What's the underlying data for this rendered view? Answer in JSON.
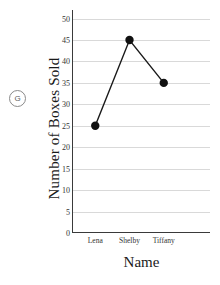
{
  "part_label": "G",
  "chart_data": {
    "type": "line",
    "title": "",
    "categories": [
      "Lena",
      "Shelby",
      "Tiffany"
    ],
    "values": [
      25,
      45,
      35
    ],
    "series": [
      {
        "name": "Boxes Sold",
        "values": [
          25,
          45,
          35
        ]
      }
    ],
    "xlabel": "Name",
    "ylabel": "Number of Boxes Sold",
    "ylim": [
      0,
      52
    ],
    "yticks": [
      0,
      5,
      10,
      15,
      20,
      25,
      30,
      35,
      40,
      45,
      50
    ],
    "ytick_labels": [
      "0",
      "5",
      "10",
      "15",
      "20",
      "25",
      "30",
      "35",
      "40",
      "45",
      "50"
    ],
    "grid": true,
    "gridlines_axis": "y",
    "legend": false,
    "marker": "filled-circle",
    "colors": {
      "line": "#1a1a1a",
      "marker": "#111111",
      "gridline": "#d9d9d9",
      "axis": "#3a3a3a",
      "background": "#ffffff"
    }
  }
}
